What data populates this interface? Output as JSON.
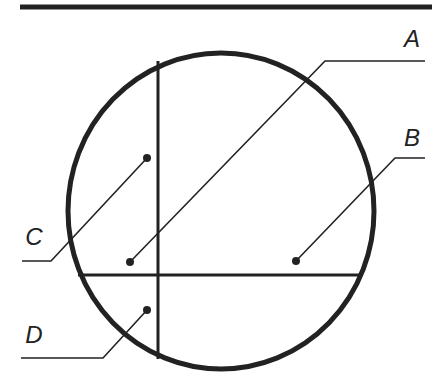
{
  "diagram": {
    "type": "sectioned-circle-with-leaders",
    "colors": {
      "stroke": "#222222",
      "background": "#ffffff"
    },
    "top_rule": {
      "x1": 20,
      "y1": 7,
      "x2": 432,
      "y2": 7
    },
    "circle": {
      "cx": 221,
      "cy": 211,
      "rx": 153,
      "ry": 158
    },
    "vertical_divider": {
      "x": 158,
      "y1": 61,
      "y2": 359
    },
    "horizontal_divider": {
      "y": 275,
      "x1": 78,
      "x2": 362
    },
    "labels": [
      {
        "id": "A",
        "text": "A",
        "x": 412,
        "y": 47,
        "dot": [
          130,
          262
        ],
        "elbow": [
          325,
          61
        ],
        "end": [
          425,
          61
        ]
      },
      {
        "id": "B",
        "text": "B",
        "x": 412,
        "y": 146,
        "dot": [
          296,
          261
        ],
        "elbow": [
          395,
          158
        ],
        "end": [
          425,
          158
        ]
      },
      {
        "id": "C",
        "text": "C",
        "x": 34,
        "y": 245,
        "dot": [
          147,
          158
        ],
        "elbow": [
          51,
          261
        ],
        "end": [
          22,
          261
        ]
      },
      {
        "id": "D",
        "text": "D",
        "x": 34,
        "y": 343,
        "dot": [
          147,
          310
        ],
        "elbow": [
          103,
          358
        ],
        "end": [
          21,
          358
        ]
      }
    ]
  }
}
